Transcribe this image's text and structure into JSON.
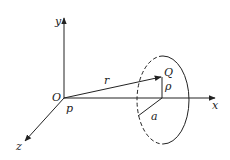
{
  "diagram": {
    "type": "3d-coordinate-geometry",
    "colors": {
      "stroke": "#222222",
      "background": "#ffffff"
    },
    "axes": {
      "x_label": "x",
      "y_label": "y",
      "z_label": "z",
      "origin_label": "O"
    },
    "points": {
      "origin_point_label": "p",
      "field_point_label": "Q"
    },
    "vectors": {
      "position_vector_label": "r"
    },
    "segments": {
      "radial_distance_label": "ρ",
      "loop_radius_label": "a"
    },
    "loop": {
      "description": "circular loop in plane perpendicular to x-axis",
      "back_half_style": "dashed",
      "front_half_style": "solid"
    }
  }
}
